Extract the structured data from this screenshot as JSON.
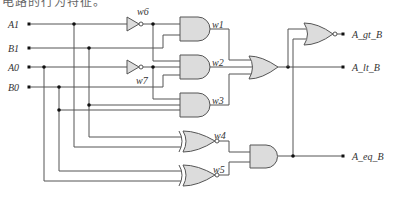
{
  "caption": "电路的行为特征。",
  "diagram": {
    "type": "2-bit magnitude comparator (gate-level)",
    "inputs": [
      "A1",
      "B1",
      "A0",
      "B0"
    ],
    "outputs": [
      "A_gt_B",
      "A_lt_B",
      "A_eq_B"
    ],
    "wires": [
      "w1",
      "w2",
      "w3",
      "w4",
      "w5",
      "w6",
      "w7"
    ],
    "gates": [
      {
        "type": "NOT",
        "output": "w6",
        "input": "A1"
      },
      {
        "type": "NOT",
        "output": "w7",
        "input": "A0"
      },
      {
        "type": "AND",
        "output": "w1"
      },
      {
        "type": "AND",
        "output": "w2"
      },
      {
        "type": "AND",
        "output": "w3"
      },
      {
        "type": "XNOR",
        "output": "w4"
      },
      {
        "type": "XNOR",
        "output": "w5"
      },
      {
        "type": "OR",
        "output": "A_lt_B"
      },
      {
        "type": "NOR",
        "output": "A_gt_B"
      },
      {
        "type": "AND",
        "output": "A_eq_B"
      }
    ],
    "colors": {
      "gate_fill": "#dcdcdc",
      "wire": "#555555",
      "junction": "#111111"
    }
  }
}
